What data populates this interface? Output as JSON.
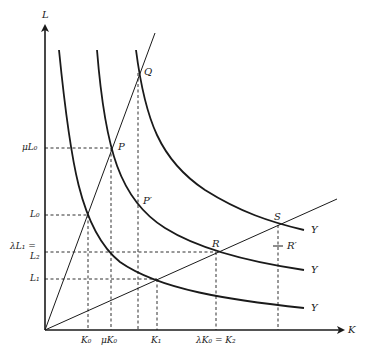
{
  "diagram": {
    "type": "isoquant-returns-to-scale",
    "axes": {
      "x_label": "K",
      "y_label": "L"
    },
    "isoquant_labels": [
      "Y",
      "Y",
      "Y"
    ],
    "points": {
      "P": "P",
      "Q": "Q",
      "P_prime": "P′",
      "R": "R",
      "S": "S",
      "R_prime": "R′"
    },
    "x_ticks": [
      "K₀",
      "μK₀",
      "K₁",
      "λK₀ = K₂"
    ],
    "y_ticks": {
      "mu_L0": "μL₀",
      "L0": "L₀",
      "lambda_L1": "λL₁ =",
      "L2": "L₂",
      "L1": "L₁"
    },
    "colors": {
      "line": "#1a1a1a",
      "background": "#ffffff"
    }
  }
}
